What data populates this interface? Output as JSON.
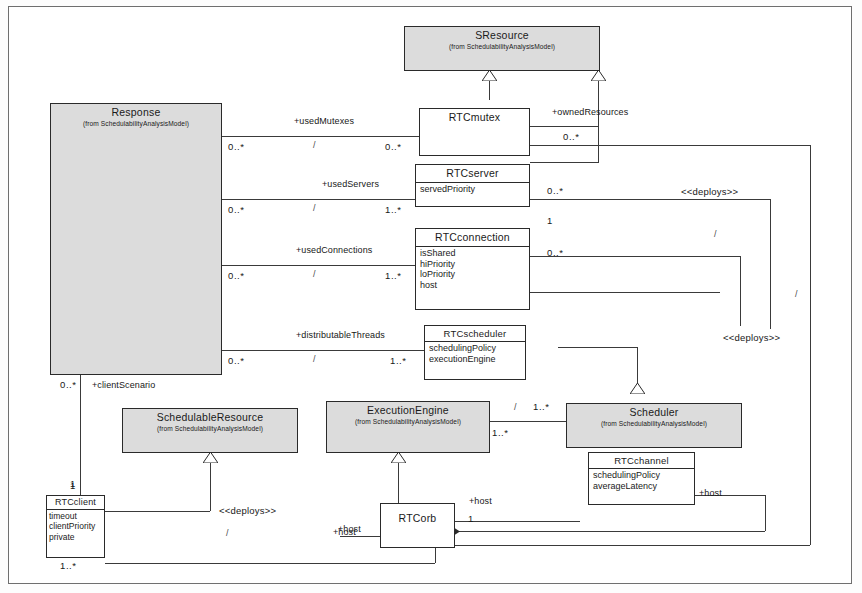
{
  "diagram": {
    "package_note": "(from SchedulabilityAnalysisModel)"
  },
  "classes": {
    "sresource": {
      "name": "SResource",
      "from": "(from SchedulabilityAnalysisModel)",
      "attributes": []
    },
    "response": {
      "name": "Response",
      "from": "(from SchedulabilityAnalysisModel)",
      "attributes": []
    },
    "rtcmutex": {
      "name": "RTCmutex",
      "from": "",
      "attributes": []
    },
    "rtcserver": {
      "name": "RTCserver",
      "from": "",
      "attributes": [
        "servedPriority"
      ]
    },
    "rtcconnection": {
      "name": "RTCconnection",
      "from": "",
      "attributes": [
        "isShared",
        "hiPriority",
        "loPriority",
        "host"
      ]
    },
    "rtcscheduler": {
      "name": "RTCscheduler",
      "from": "",
      "attributes": [
        "schedulingPolicy",
        "executionEngine"
      ]
    },
    "schedulableresource": {
      "name": "SchedulableResource",
      "from": "(from SchedulabilityAnalysisModel)",
      "attributes": []
    },
    "executionengine": {
      "name": "ExecutionEngine",
      "from": "(from SchedulabilityAnalysisModel)",
      "attributes": []
    },
    "scheduler": {
      "name": "Scheduler",
      "from": "(from SchedulabilityAnalysisModel)",
      "attributes": []
    },
    "rtcchannel": {
      "name": "RTCchannel",
      "from": "",
      "attributes": [
        "schedulingPolicy",
        "averageLatency"
      ]
    },
    "rtcclient": {
      "name": "RTCclient",
      "from": "",
      "attributes": [
        "timeout",
        "clientPriority",
        "private"
      ]
    },
    "rtcorb": {
      "name": "RTCorb",
      "from": "",
      "attributes": []
    }
  },
  "associations": {
    "used_mutexes": {
      "role": "+usedMutexes",
      "source_mult": "0..*",
      "target_mult": "0..*",
      "slash": "/"
    },
    "used_servers": {
      "role": "+usedServers",
      "source_mult": "0..*",
      "target_mult": "1..*",
      "slash": "/"
    },
    "used_connections": {
      "role": "+usedConnections",
      "source_mult": "0..*",
      "target_mult": "1..*",
      "slash": "/"
    },
    "distributable_threads": {
      "role": "+distributableThreads",
      "source_mult": "0..*",
      "target_mult": "1..*",
      "slash": "/"
    },
    "owned_resources": {
      "role": "+ownedResources",
      "source_mult": "0..*",
      "target_mult": ""
    },
    "client_scenario": {
      "role": "+clientScenario",
      "source_mult": "0..*",
      "target_mult": "1"
    },
    "server_mult_right": {
      "role": "",
      "source_mult": "0..*",
      "target_mult": "1"
    },
    "connection_mult_right": {
      "role": "",
      "source_mult": "0..*",
      "target_mult": ""
    },
    "engine_scheduler": {
      "role": "",
      "source_mult": "1..*",
      "target_mult": "1..*",
      "slash": "/"
    },
    "orb_host_right": {
      "role": "+host",
      "source_mult": "1",
      "target_mult": ""
    },
    "orb_host_left": {
      "role": "+host",
      "source_mult": "",
      "target_mult": ""
    },
    "channel_host": {
      "role": "+host",
      "source_mult": "",
      "target_mult": ""
    },
    "client_orb": {
      "role": "",
      "source_mult": "1..*",
      "target_mult": ""
    },
    "client_top": {
      "role": "",
      "source_mult": "1",
      "target_mult": ""
    }
  },
  "stereotypes": {
    "deploys_top_right": "<<deploys>>",
    "deploys_mid_right": "<<deploys>>",
    "deploys_bottom": "<<deploys>>"
  },
  "slashes": {
    "s1": "/",
    "s2": "/",
    "s3": "/",
    "s4": "/",
    "s5": "/",
    "s6": "/",
    "s7": "/",
    "s8": "/",
    "s9": "/"
  },
  "colors": {
    "line": "#3a3a3a",
    "box_border": "#2a2a2a",
    "shaded_fill": "#dcdcdc",
    "white_fill": "#ffffff",
    "text": "#1a1a1a"
  }
}
